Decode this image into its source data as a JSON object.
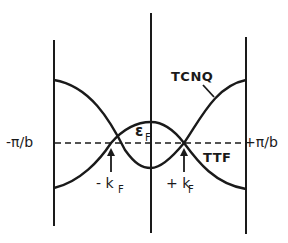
{
  "diagram": {
    "type": "band-structure",
    "labels": {
      "left_boundary": "-π/b",
      "right_boundary": "+π/b",
      "fermi_energy": "ε",
      "fermi_energy_sub": "F",
      "minus_kf": "- k",
      "minus_kf_sub": "F",
      "plus_kf": "+ k",
      "plus_kf_sub": "F",
      "band_upper": "TCNQ",
      "band_lower": "TTF"
    },
    "colors": {
      "ink": "#1a1a1a",
      "background": "#ffffff"
    }
  }
}
